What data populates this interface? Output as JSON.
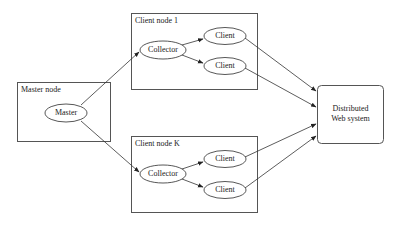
{
  "diagram": {
    "master_group": {
      "label": "Master node",
      "node": "Master"
    },
    "client_groups": [
      {
        "label": "Client node 1",
        "collector": "Collector",
        "clients": [
          "Client",
          "Client"
        ]
      },
      {
        "label": "Client node K",
        "collector": "Collector",
        "clients": [
          "Client",
          "Client"
        ]
      }
    ],
    "target": {
      "line1": "Distributed",
      "line2": "Web system"
    },
    "edges": [
      {
        "from": "Master",
        "to": "Collector (Client node 1)"
      },
      {
        "from": "Master",
        "to": "Collector (Client node K)"
      },
      {
        "from": "Collector (Client node 1)",
        "to": "Client 1a"
      },
      {
        "from": "Collector (Client node 1)",
        "to": "Client 1b"
      },
      {
        "from": "Collector (Client node K)",
        "to": "Client Ka"
      },
      {
        "from": "Collector (Client node K)",
        "to": "Client Kb"
      },
      {
        "from": "Client 1a",
        "to": "Distributed Web system"
      },
      {
        "from": "Client 1b",
        "to": "Distributed Web system"
      },
      {
        "from": "Client Ka",
        "to": "Distributed Web system"
      },
      {
        "from": "Client Kb",
        "to": "Distributed Web system"
      }
    ]
  }
}
